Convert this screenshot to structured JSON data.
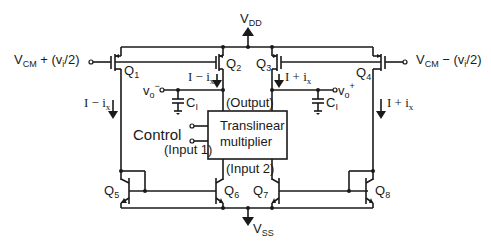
{
  "diagram": {
    "supplies": {
      "vdd": {
        "main": "V",
        "sub": "DD"
      },
      "vss": {
        "main": "V",
        "sub": "SS"
      }
    },
    "inputs": {
      "left": {
        "main": "V",
        "sub": "CM",
        "rest": " + (v",
        "sub2": "i",
        "tail": "/2)"
      },
      "right": {
        "main": "V",
        "sub": "CM",
        "rest": " − (v",
        "sub2": "i",
        "tail": "/2)"
      }
    },
    "transistors": {
      "q1": {
        "main": "Q",
        "sub": "1"
      },
      "q2": {
        "main": "Q",
        "sub": "2"
      },
      "q3": {
        "main": "Q",
        "sub": "3"
      },
      "q4": {
        "main": "Q",
        "sub": "4"
      },
      "q5": {
        "main": "Q",
        "sub": "5"
      },
      "q6": {
        "main": "Q",
        "sub": "6"
      },
      "q7": {
        "main": "Q",
        "sub": "7"
      },
      "q8": {
        "main": "Q",
        "sub": "8"
      }
    },
    "currents": {
      "left_outer": {
        "main": "I − i",
        "sub": "x"
      },
      "left_inner": {
        "main": "I − i",
        "sub": "x"
      },
      "right_inner": {
        "main": "I + i",
        "sub": "x"
      },
      "right_outer": {
        "main": "I + i",
        "sub": "x"
      }
    },
    "outputs": {
      "vo_minus": {
        "main": "v",
        "sub": "o",
        "sup": "−"
      },
      "vo_plus": {
        "main": "v",
        "sub": "o",
        "sup": "+"
      }
    },
    "capacitors": {
      "left": {
        "main": "C",
        "sub": "I"
      },
      "right": {
        "main": "C",
        "sub": "I"
      }
    },
    "block": {
      "line1": "Translinear",
      "line2": "multiplier",
      "output_label": "(Output)",
      "input1_label": "(Input 1)",
      "input2_label": "(Input 2)",
      "control_label": "Control"
    }
  }
}
